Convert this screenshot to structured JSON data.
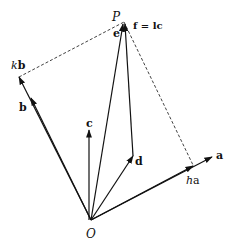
{
  "diagram": {
    "points": {
      "O": {
        "label": "O",
        "x": 91,
        "y": 220
      },
      "P": {
        "label": "P",
        "x": 124,
        "y": 22
      }
    },
    "vectors": [
      {
        "name": "a",
        "label": "a",
        "from": [
          91,
          220
        ],
        "to": [
          212,
          158
        ]
      },
      {
        "name": "b",
        "label": "b",
        "from": [
          91,
          220
        ],
        "to": [
          31,
          98
        ]
      },
      {
        "name": "c",
        "label": "c",
        "from": [
          91,
          220
        ],
        "to": [
          89,
          132
        ]
      },
      {
        "name": "d",
        "label": "d",
        "from": [
          91,
          220
        ],
        "to": [
          133,
          156
        ]
      },
      {
        "name": "e",
        "label": "e",
        "from": [
          91,
          220
        ],
        "to": [
          124,
          22
        ]
      },
      {
        "name": "f",
        "label": "f = lc",
        "from": [
          133,
          156
        ],
        "to": [
          124,
          22
        ]
      }
    ],
    "labels": {
      "P": "P",
      "O": "O",
      "e": "e",
      "f_eq": "f = lc",
      "kb": "kb",
      "kb_k": "k",
      "kb_b": "b",
      "b": "b",
      "c": "c",
      "d": "d",
      "a": "a",
      "ha_h": "h",
      "ha_a": "a"
    },
    "dashed_lines": [
      {
        "name": "kb-to-P",
        "from": [
          19,
          77
        ],
        "to": [
          124,
          22
        ]
      },
      {
        "name": "P-to-ha",
        "from": [
          124,
          22
        ],
        "to": [
          193,
          165
        ]
      }
    ],
    "colors": {
      "stroke": "#111111",
      "background": "#ffffff"
    }
  }
}
